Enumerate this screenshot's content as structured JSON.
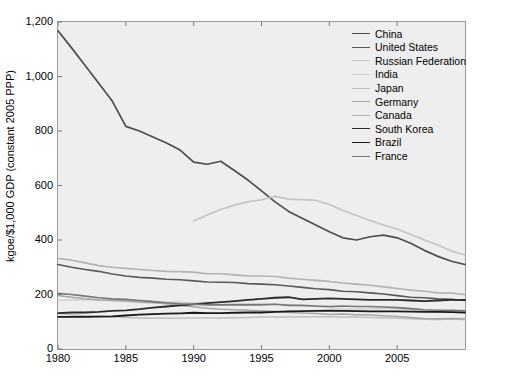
{
  "chart_data": {
    "type": "line",
    "title": "",
    "xlabel": "",
    "ylabel": "kgoe/$1,000 GDP (constant 2005 PPP)",
    "xlim": [
      1980,
      2010
    ],
    "ylim": [
      0,
      1200
    ],
    "xticks": [
      1980,
      1985,
      1990,
      1995,
      2000,
      2005
    ],
    "xtick_labels": [
      "1980",
      "1985",
      "1990",
      "1995",
      "2000",
      "2005"
    ],
    "yticks": [
      0,
      200,
      400,
      600,
      800,
      1000,
      1200
    ],
    "ytick_labels": [
      "0",
      "200",
      "400",
      "600",
      "800",
      "1,000",
      "1,200"
    ],
    "grid": false,
    "legend_position": "top-right",
    "x": [
      1980,
      1981,
      1982,
      1983,
      1984,
      1985,
      1986,
      1987,
      1988,
      1989,
      1990,
      1991,
      1992,
      1993,
      1994,
      1995,
      1996,
      1997,
      1998,
      1999,
      2000,
      2001,
      2002,
      2003,
      2004,
      2005,
      2006,
      2007,
      2008,
      2009,
      2010
    ],
    "series": [
      {
        "name": "China",
        "color": "#4d4d4d",
        "width": 1.7,
        "values": [
          1168,
          1105,
          1040,
          975,
          910,
          817,
          800,
          778,
          756,
          730,
          686,
          678,
          689,
          655,
          620,
          580,
          540,
          505,
          480,
          455,
          430,
          408,
          400,
          412,
          418,
          408,
          388,
          362,
          340,
          322,
          310
        ]
      },
      {
        "name": "United States",
        "color": "#595959",
        "width": 1.6,
        "values": [
          310,
          300,
          292,
          285,
          275,
          268,
          263,
          260,
          256,
          254,
          250,
          246,
          245,
          244,
          240,
          238,
          236,
          231,
          226,
          221,
          218,
          212,
          210,
          206,
          202,
          196,
          190,
          188,
          184,
          182,
          178
        ]
      },
      {
        "name": "Russian Federation",
        "color": "#c4c4c4",
        "width": 1.6,
        "values": [
          null,
          null,
          null,
          null,
          null,
          null,
          null,
          null,
          null,
          null,
          470,
          492,
          512,
          528,
          540,
          548,
          560,
          550,
          548,
          546,
          530,
          508,
          490,
          472,
          455,
          440,
          420,
          400,
          382,
          360,
          345
        ]
      },
      {
        "name": "India",
        "color": "#d0d0d0",
        "width": 1.5,
        "values": [
          178,
          180,
          182,
          180,
          178,
          176,
          176,
          174,
          172,
          172,
          170,
          172,
          170,
          168,
          166,
          166,
          164,
          162,
          158,
          156,
          152,
          148,
          146,
          148,
          150,
          148,
          144,
          140,
          138,
          136,
          134
        ]
      },
      {
        "name": "Japan",
        "color": "#bfbfbf",
        "width": 1.5,
        "values": [
          130,
          126,
          122,
          120,
          118,
          116,
          114,
          113,
          113,
          113,
          114,
          114,
          114,
          115,
          116,
          117,
          117,
          117,
          118,
          118,
          118,
          117,
          117,
          116,
          115,
          113,
          111,
          109,
          108,
          110,
          108
        ]
      },
      {
        "name": "Germany",
        "color": "#a6a6a6",
        "width": 1.5,
        "values": [
          196,
          190,
          184,
          180,
          178,
          176,
          172,
          170,
          166,
          160,
          155,
          150,
          146,
          144,
          142,
          140,
          138,
          134,
          132,
          130,
          127,
          128,
          126,
          125,
          122,
          119,
          116,
          112,
          111,
          112,
          111
        ]
      },
      {
        "name": "Canada",
        "color": "#b3b3b3",
        "width": 1.6,
        "values": [
          332,
          326,
          316,
          306,
          300,
          296,
          292,
          288,
          285,
          284,
          282,
          276,
          276,
          272,
          268,
          268,
          266,
          260,
          256,
          252,
          248,
          242,
          238,
          234,
          228,
          222,
          216,
          212,
          206,
          205,
          200
        ]
      },
      {
        "name": "South Korea",
        "color": "#2b2b2b",
        "width": 1.8,
        "values": [
          132,
          134,
          134,
          136,
          140,
          142,
          146,
          152,
          156,
          160,
          164,
          168,
          172,
          176,
          180,
          184,
          188,
          190,
          182,
          184,
          186,
          184,
          182,
          180,
          180,
          180,
          178,
          176,
          178,
          180,
          180
        ]
      },
      {
        "name": "Brazil",
        "color": "#1a1a1a",
        "width": 1.8,
        "values": [
          118,
          118,
          118,
          119,
          120,
          123,
          126,
          128,
          130,
          131,
          133,
          132,
          132,
          133,
          134,
          134,
          136,
          138,
          139,
          140,
          141,
          140,
          139,
          138,
          138,
          138,
          137,
          136,
          136,
          135,
          134
        ]
      },
      {
        "name": "France",
        "color": "#777777",
        "width": 1.6,
        "values": [
          204,
          200,
          194,
          188,
          184,
          182,
          178,
          174,
          170,
          166,
          164,
          162,
          162,
          162,
          162,
          162,
          164,
          160,
          160,
          158,
          156,
          158,
          156,
          156,
          154,
          152,
          148,
          144,
          142,
          142,
          140
        ]
      }
    ]
  },
  "legend": {
    "items": [
      {
        "label": "China"
      },
      {
        "label": "United States"
      },
      {
        "label": "Russian Federation"
      },
      {
        "label": "India"
      },
      {
        "label": "Japan"
      },
      {
        "label": "Germany"
      },
      {
        "label": "Canada"
      },
      {
        "label": "South Korea"
      },
      {
        "label": "Brazil"
      },
      {
        "label": "France"
      }
    ]
  }
}
